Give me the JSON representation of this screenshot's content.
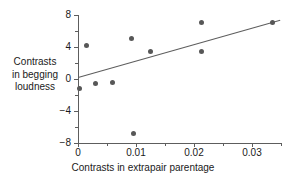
{
  "chart_data": {
    "type": "scatter",
    "title": "",
    "xlabel": "Contrasts in extrapair parentage",
    "ylabel_lines": [
      "Contrasts",
      "in begging",
      "loudness"
    ],
    "xlim": [
      -0.0005,
      0.035
    ],
    "ylim": [
      -8,
      8
    ],
    "xticks": [
      0,
      0.01,
      0.02,
      0.03
    ],
    "xtick_labels": [
      "0",
      "0.01",
      "0.02",
      "0.03"
    ],
    "xticks_minor": [
      0.005,
      0.015,
      0.025,
      0.035
    ],
    "yticks": [
      8,
      4,
      0,
      -4,
      -8
    ],
    "ytick_labels": [
      "8",
      "4",
      "0",
      "−4",
      "−8"
    ],
    "yticks_minor": [
      6,
      2,
      -2,
      -6
    ],
    "grid": false,
    "legend": "none",
    "marker_color": "#575757",
    "axis_color": "#5d5d5d",
    "text_color": "#1a1a1a",
    "points": [
      {
        "x": 0.0003,
        "y": -1.2
      },
      {
        "x": 0.00155,
        "y": 4.2
      },
      {
        "x": 0.0031,
        "y": -0.6
      },
      {
        "x": 0.006,
        "y": -0.4
      },
      {
        "x": 0.0092,
        "y": 5.1
      },
      {
        "x": 0.0095,
        "y": -6.8
      },
      {
        "x": 0.0125,
        "y": 3.5
      },
      {
        "x": 0.0213,
        "y": 7.1
      },
      {
        "x": 0.02135,
        "y": 3.5
      },
      {
        "x": 0.0335,
        "y": 7.1
      }
    ],
    "trendline": {
      "x0": 0.0,
      "y0": 0.2,
      "x1": 0.0348,
      "y1": 7.35
    }
  }
}
